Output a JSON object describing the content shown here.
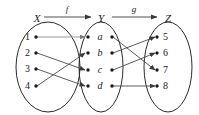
{
  "diagram": {
    "type": "function-composition-mapping-diagram",
    "sets": [
      {
        "id": "X",
        "label": "X",
        "elements": [
          "1",
          "2",
          "3",
          "4"
        ]
      },
      {
        "id": "Y",
        "label": "Y",
        "elements": [
          "a",
          "b",
          "c",
          "d"
        ]
      },
      {
        "id": "Z",
        "label": "Z",
        "elements": [
          "5",
          "6",
          "7",
          "8"
        ]
      }
    ],
    "functions": [
      {
        "id": "f",
        "label": "f",
        "from": "X",
        "to": "Y"
      },
      {
        "id": "g",
        "label": "g",
        "from": "Y",
        "to": "Z"
      }
    ],
    "mappings_f": [
      {
        "from": "1",
        "to": "a"
      },
      {
        "from": "2",
        "to": "c"
      },
      {
        "from": "3",
        "to": "d"
      },
      {
        "from": "4",
        "to": "b"
      }
    ],
    "mappings_g": [
      {
        "from": "a",
        "to": "7"
      },
      {
        "from": "b",
        "to": "5"
      },
      {
        "from": "c",
        "to": "6"
      },
      {
        "from": "d",
        "to": "8"
      }
    ],
    "colors": {
      "stroke": "#2b2b2b",
      "line": "#4a4a4a",
      "node": "#1a1a1a",
      "background": "#ffffff"
    }
  }
}
